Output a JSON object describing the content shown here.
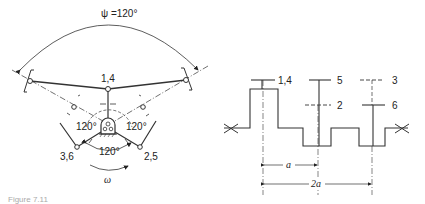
{
  "left_diagram": {
    "angle_label": "ψ =120°",
    "top_node_label": "1,4",
    "left_bottom_label": "3,6",
    "right_bottom_label": "2,5",
    "angle_left": "120°",
    "angle_right": "120°",
    "angle_bottom": "120°",
    "rotation_label": "ω"
  },
  "right_diagram": {
    "throw_labels": [
      "1,4",
      "5",
      "2",
      "3",
      "6"
    ],
    "dim_a": "a",
    "dim_2a": "2a"
  },
  "caption": "Figure 7.11"
}
